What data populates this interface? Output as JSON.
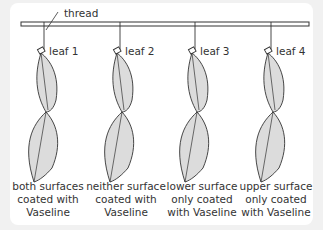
{
  "thread_label": "thread",
  "leaves": [
    {
      "label": "leaf 1",
      "caption": [
        "both surfaces",
        "coated with",
        "Vaseline"
      ]
    },
    {
      "label": "leaf 2",
      "caption": [
        "neither surface",
        "coated with",
        "Vaseline"
      ]
    },
    {
      "label": "leaf 3",
      "caption": [
        "lower surface",
        "only coated",
        "with Vaseline"
      ]
    },
    {
      "label": "leaf 4",
      "caption": [
        "upper surface",
        "only coated",
        "with Vaseline"
      ]
    }
  ],
  "colors": {
    "leaf_fill": "#dcdcdc",
    "outline": "#333333",
    "background": "#f1f1f1",
    "panel": "#ffffff"
  }
}
